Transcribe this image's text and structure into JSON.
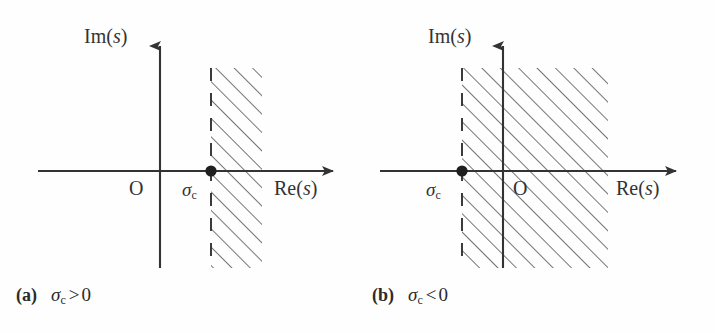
{
  "figure": {
    "type": "two-panel-diagram",
    "stroke_color": "#333333",
    "hatch_color": "#6e6e6e",
    "background": "#ffffff"
  },
  "panels": [
    {
      "id": "a",
      "caption_tag": "(a)",
      "caption_symbol": "σ",
      "caption_subscript": "c",
      "caption_operator": ">",
      "caption_value": "0",
      "axis_label_imag": "Im(",
      "axis_label_imag_var": "s",
      "axis_label_imag_close": ")",
      "axis_label_real": "Re(",
      "axis_label_real_var": "s",
      "axis_label_real_close": ")",
      "origin_label": "O",
      "sigma_label": "σ",
      "sigma_subscript": "c",
      "roc_side": "right-of-sigma-c",
      "sigma_c_sign": "positive",
      "geometry": {
        "origin_x": 160,
        "axis_y": 171,
        "sigma_c_x": 211,
        "hatch_left": 211,
        "hatch_right": 262,
        "hatch_top": 68,
        "hatch_bottom": 268
      }
    },
    {
      "id": "b",
      "caption_tag": "(b)",
      "caption_symbol": "σ",
      "caption_subscript": "c",
      "caption_operator": "<",
      "caption_value": "0",
      "axis_label_imag": "Im(",
      "axis_label_imag_var": "s",
      "axis_label_imag_close": ")",
      "axis_label_real": "Re(",
      "axis_label_real_var": "s",
      "axis_label_real_close": ")",
      "origin_label": "O",
      "sigma_label": "σ",
      "sigma_subscript": "c",
      "roc_side": "right-of-sigma-c",
      "sigma_c_sign": "negative",
      "geometry": {
        "origin_x": 145,
        "axis_y": 171,
        "sigma_c_x": 104,
        "hatch_left": 104,
        "hatch_right": 250,
        "hatch_top": 68,
        "hatch_bottom": 268
      }
    }
  ]
}
